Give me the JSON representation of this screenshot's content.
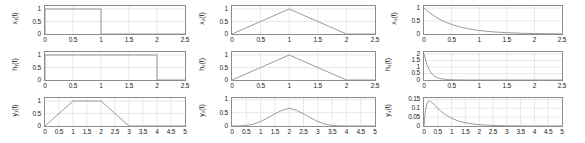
{
  "figure": {
    "title": "",
    "rows": 3,
    "cols": 3,
    "line_color": "#8f8f8f",
    "axis_color": "#8c8c8c",
    "grid_color": "#d9d9d9",
    "background": "#ffffff"
  },
  "chart_data": [
    {
      "id": "x1",
      "type": "line",
      "title": "",
      "xlabel": "",
      "ylabel": "x₁(t)",
      "ylabel_plain": "x_1(t)",
      "xlim": [
        0,
        2.5
      ],
      "ylim": [
        0,
        1.12
      ],
      "xticks": [
        0,
        0.5,
        1,
        1.5,
        2,
        2.5
      ],
      "xticklabels": [
        "0",
        "0.5",
        "1",
        "1.5",
        "2",
        "2.5"
      ],
      "yticks": [
        0,
        0.5,
        1
      ],
      "yticklabels": [
        "0",
        "0.5",
        "1"
      ],
      "grid": true,
      "description": "unit rectangular pulse on 0<=t<1",
      "x": [
        0,
        0,
        1,
        1,
        2.5
      ],
      "y": [
        0,
        1,
        1,
        0,
        0
      ]
    },
    {
      "id": "h1",
      "type": "line",
      "title": "",
      "xlabel": "",
      "ylabel": "h₁(t)",
      "ylabel_plain": "h_1(t)",
      "xlim": [
        0,
        2.5
      ],
      "ylim": [
        0,
        1.12
      ],
      "xticks": [
        0,
        0.5,
        1,
        1.5,
        2,
        2.5
      ],
      "xticklabels": [
        "0",
        "0.5",
        "1",
        "1.5",
        "2",
        "2.5"
      ],
      "yticks": [
        0,
        0.5,
        1
      ],
      "yticklabels": [
        "0",
        "0.5",
        "1"
      ],
      "grid": true,
      "description": "unit rectangular pulse on 0<=t<2",
      "x": [
        0,
        0,
        2,
        2,
        2.5
      ],
      "y": [
        0,
        1,
        1,
        0,
        0
      ]
    },
    {
      "id": "y1",
      "type": "line",
      "title": "",
      "xlabel": "",
      "ylabel": "y₁(t)",
      "ylabel_plain": "y_1(t)",
      "xlim": [
        0,
        5
      ],
      "ylim": [
        0,
        1.12
      ],
      "xticks": [
        0,
        0.5,
        1,
        1.5,
        2,
        2.5,
        3,
        3.5,
        4,
        4.5,
        5
      ],
      "xticklabels": [
        "0",
        "0.5",
        "1",
        "1.5",
        "2",
        "2.5",
        "3",
        "3.5",
        "4",
        "4.5",
        "5"
      ],
      "yticks": [
        0,
        0.5,
        1
      ],
      "yticklabels": [
        "0",
        "0.5",
        "1"
      ],
      "grid": true,
      "description": "trapezoid: convolution of rect(0..1) with rect(0..2)",
      "x": [
        0,
        1,
        2,
        3,
        5
      ],
      "y": [
        0,
        1,
        1,
        0,
        0
      ]
    },
    {
      "id": "x2",
      "type": "line",
      "title": "",
      "xlabel": "",
      "ylabel": "x₂(t)",
      "ylabel_plain": "x_2(t)",
      "xlim": [
        0,
        2.5
      ],
      "ylim": [
        0,
        1.12
      ],
      "xticks": [
        0,
        0.5,
        1,
        1.5,
        2,
        2.5
      ],
      "xticklabels": [
        "0",
        "0.5",
        "1",
        "1.5",
        "2",
        "2.5"
      ],
      "yticks": [
        0,
        0.5,
        1
      ],
      "yticklabels": [
        "0",
        "0.5",
        "1"
      ],
      "grid": true,
      "description": "triangle peaking at t=1 with amplitude 1",
      "x": [
        0,
        1,
        2,
        2.5
      ],
      "y": [
        0,
        1,
        0,
        0
      ]
    },
    {
      "id": "h2",
      "type": "line",
      "title": "",
      "xlabel": "",
      "ylabel": "h₂(t)",
      "ylabel_plain": "h_2(t)",
      "xlim": [
        0,
        2.5
      ],
      "ylim": [
        0,
        1.12
      ],
      "xticks": [
        0,
        0.5,
        1,
        1.5,
        2,
        2.5
      ],
      "xticklabels": [
        "0",
        "0.5",
        "1",
        "1.5",
        "2",
        "2.5"
      ],
      "yticks": [
        0,
        0.5,
        1
      ],
      "yticklabels": [
        "0",
        "0.5",
        "1"
      ],
      "grid": true,
      "description": "triangle peaking at t=1 with amplitude 1",
      "x": [
        0,
        1,
        2,
        2.5
      ],
      "y": [
        0,
        1,
        0,
        0
      ]
    },
    {
      "id": "y2",
      "type": "line",
      "title": "",
      "xlabel": "",
      "ylabel": "y₂(t)",
      "ylabel_plain": "y_2(t)",
      "xlim": [
        0,
        5
      ],
      "ylim": [
        0,
        1.05
      ],
      "xticks": [
        0,
        0.5,
        1,
        1.5,
        2,
        2.5,
        3,
        3.5,
        4,
        4.5,
        5
      ],
      "xticklabels": [
        "0",
        "0.5",
        "1",
        "1.5",
        "2",
        "2.5",
        "3",
        "3.5",
        "4",
        "4.5",
        "5"
      ],
      "yticks": [
        0,
        0.5,
        1
      ],
      "yticklabels": [
        "0",
        "0.5",
        "1"
      ],
      "grid": true,
      "description": "smooth bump, convolution of two triangles, peak 0.66 at t=2, support 0..4",
      "x": [
        0,
        0.25,
        0.5,
        0.75,
        1,
        1.25,
        1.5,
        1.75,
        2,
        2.25,
        2.5,
        2.75,
        3,
        3.25,
        3.5,
        3.75,
        4,
        4.5,
        5
      ],
      "y": [
        0,
        0.003,
        0.021,
        0.07,
        0.167,
        0.306,
        0.458,
        0.59,
        0.665,
        0.59,
        0.458,
        0.306,
        0.167,
        0.07,
        0.021,
        0.003,
        0,
        0,
        0
      ]
    },
    {
      "id": "x3",
      "type": "line",
      "title": "",
      "xlabel": "",
      "ylabel": "x₃(t)",
      "ylabel_plain": "x_3(t)",
      "xlim": [
        0,
        2.5
      ],
      "ylim": [
        0,
        1.08
      ],
      "xticks": [
        0,
        0.5,
        1,
        1.5,
        2,
        2.5
      ],
      "xticklabels": [
        "0",
        "0.5",
        "1",
        "1.5",
        "2",
        "2.5"
      ],
      "yticks": [
        0,
        0.5,
        1
      ],
      "yticklabels": [
        "0",
        "0.5",
        "1"
      ],
      "grid": true,
      "description": "decaying exponential exp(-2t) starting at 1",
      "x": [
        0,
        0.125,
        0.25,
        0.375,
        0.5,
        0.625,
        0.75,
        0.875,
        1,
        1.25,
        1.5,
        1.75,
        2,
        2.25,
        2.5
      ],
      "y": [
        1,
        0.779,
        0.607,
        0.472,
        0.368,
        0.287,
        0.223,
        0.174,
        0.135,
        0.082,
        0.05,
        0.03,
        0.018,
        0.011,
        0.0067
      ]
    },
    {
      "id": "h3",
      "type": "line",
      "title": "",
      "xlabel": "",
      "ylabel": "h₃(t)",
      "ylabel_plain": "h_3(t)",
      "xlim": [
        0,
        2.5
      ],
      "ylim": [
        0,
        2.15
      ],
      "xticks": [
        0,
        0.5,
        1,
        1.5,
        2,
        2.5
      ],
      "xticklabels": [
        "0",
        "0.5",
        "1",
        "1.5",
        "2",
        "2.5"
      ],
      "yticks": [
        0,
        0.5,
        1,
        1.5,
        2
      ],
      "yticklabels": [
        "0",
        "0.5",
        "1",
        "1.5",
        "2"
      ],
      "grid": true,
      "description": "decaying exponential 2*exp(-10t) starting at 2",
      "x": [
        0,
        0.05,
        0.1,
        0.15,
        0.2,
        0.25,
        0.3,
        0.4,
        0.5,
        0.75,
        1,
        1.5,
        2,
        2.5
      ],
      "y": [
        2,
        1.213,
        0.736,
        0.446,
        0.271,
        0.164,
        0.0996,
        0.0366,
        0.0135,
        0.0011,
        0.0001,
        0,
        0,
        0
      ]
    },
    {
      "id": "y3",
      "type": "line",
      "title": "",
      "xlabel": "",
      "ylabel": "y₃(t)",
      "ylabel_plain": "y_3(t)",
      "xlim": [
        0,
        5
      ],
      "ylim": [
        0,
        0.158
      ],
      "xticks": [
        0,
        0.5,
        1,
        1.5,
        2,
        2.5,
        3,
        3.5,
        4,
        4.5,
        5
      ],
      "xticklabels": [
        "0",
        "0.5",
        "1",
        "1.5",
        "2",
        "2.5",
        "3",
        "3.5",
        "4",
        "4.5",
        "5"
      ],
      "yticks": [
        0,
        0.05,
        0.1,
        0.15
      ],
      "yticklabels": [
        "0",
        "0.05",
        "0.1",
        "0.15"
      ],
      "grid": true,
      "description": "convolution of two decaying exponentials, rises to peak 0.14 near t=0.18 then decays",
      "x": [
        0,
        0.05,
        0.1,
        0.15,
        0.2,
        0.25,
        0.3,
        0.4,
        0.5,
        0.6,
        0.75,
        1,
        1.25,
        1.5,
        1.75,
        2,
        2.5,
        3,
        3.5,
        4,
        4.5,
        5
      ],
      "y": [
        0,
        0.0863,
        0.1244,
        0.1387,
        0.1414,
        0.1377,
        0.1312,
        0.1155,
        0.0996,
        0.0852,
        0.0669,
        0.0437,
        0.0282,
        0.0181,
        0.0116,
        0.0074,
        0.003,
        0.0012,
        0.0005,
        0.0002,
        0.0001,
        4e-05
      ]
    }
  ]
}
